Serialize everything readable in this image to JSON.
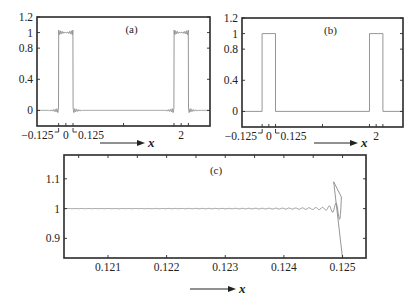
{
  "chart_data": [
    {
      "id": "a",
      "type": "line",
      "panel_label": "(a)",
      "description": "Fourier partial sum of periodic square pulse with Gibbs oscillations",
      "xlim": [
        -0.5,
        2.5
      ],
      "ylim": [
        -0.2,
        1.2
      ],
      "yticks": [
        {
          "v": 1.2,
          "label": "1.2"
        },
        {
          "v": 1,
          "label": "1"
        },
        {
          "v": 0.8,
          "label": "0.8"
        },
        {
          "v": 0.4,
          "label": "0.4"
        },
        {
          "v": 0,
          "label": "0"
        }
      ],
      "xtick_labels": [
        {
          "v": -0.125,
          "label": "−0.125"
        },
        {
          "v": 0,
          "label": "0"
        },
        {
          "v": 0.125,
          "label": "0.125"
        },
        {
          "v": 2,
          "label": "2"
        }
      ],
      "pulse_centers": [
        0,
        2
      ],
      "pulse_halfwidth": 0.125,
      "pulse_height": 1,
      "oscillating": true,
      "xlabel": "x"
    },
    {
      "id": "b",
      "type": "line",
      "panel_label": "(b)",
      "description": "Ideal periodic square pulse",
      "xlim": [
        -0.5,
        2.5
      ],
      "ylim": [
        -0.2,
        1.2
      ],
      "yticks": [
        {
          "v": 1.2,
          "label": "1.2"
        },
        {
          "v": 1,
          "label": "1"
        },
        {
          "v": 0.8,
          "label": "0.8"
        },
        {
          "v": 0.4,
          "label": "0.4"
        },
        {
          "v": 0,
          "label": "0"
        }
      ],
      "xtick_labels": [
        {
          "v": -0.125,
          "label": "−0.125"
        },
        {
          "v": 0,
          "label": "0"
        },
        {
          "v": 0.125,
          "label": "0.125"
        },
        {
          "v": 2,
          "label": "2"
        }
      ],
      "pulse_centers": [
        0,
        2
      ],
      "pulse_halfwidth": 0.125,
      "pulse_height": 1,
      "oscillating": false,
      "xlabel": "x"
    },
    {
      "id": "c",
      "type": "line",
      "panel_label": "(c)",
      "description": "Zoom of Gibbs oscillations near the pulse edge",
      "xlim": [
        0.12025,
        0.1254
      ],
      "ylim": [
        0.834,
        1.18
      ],
      "yticks": [
        {
          "v": 1.1,
          "label": "1.1"
        },
        {
          "v": 1,
          "label": "1"
        },
        {
          "v": 0.9,
          "label": "0.9"
        }
      ],
      "xtick_labels": [
        {
          "v": 0.121,
          "label": "0.121"
        },
        {
          "v": 0.122,
          "label": "0.122"
        },
        {
          "v": 0.123,
          "label": "0.123"
        },
        {
          "v": 0.124,
          "label": "0.124"
        },
        {
          "v": 0.125,
          "label": "0.125"
        }
      ],
      "edge_x": 0.125,
      "last_peak": {
        "x": 0.12485,
        "y": 1.09
      },
      "last_trough": {
        "x": 0.1248,
        "y": 0.955
      },
      "xlabel": "x"
    }
  ]
}
